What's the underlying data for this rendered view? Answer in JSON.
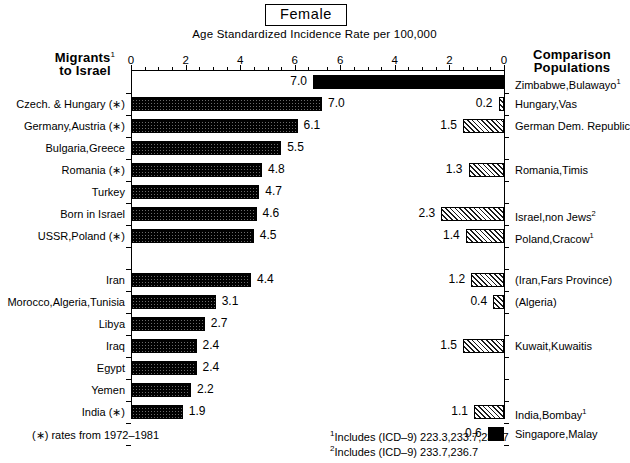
{
  "title": "Female",
  "subtitle": "Age Standardized Incidence Rate per 100,000",
  "headers": {
    "left_line1": "Migrants",
    "left_sup": "1",
    "left_line2": "to Israel",
    "right_line1": "Comparison",
    "right_line2": "Populations"
  },
  "axes": {
    "left_ticks": [
      "0",
      "2",
      "4",
      "6"
    ],
    "right_ticks": [
      "6",
      "4",
      "2",
      "0"
    ],
    "max": 7.4,
    "tick_step": 2,
    "minor_step": 0.5
  },
  "footnotes": {
    "left": "(∗) rates from 1972–1981",
    "right1_sup": "1",
    "right1": "Includes (ICD–9) 223.3,233.7,236.7",
    "right2_sup": "2",
    "right2": "Includes (ICD–9) 233.7,236.7"
  },
  "colors": {
    "solid": "#000000",
    "bar_dark": "#6a6a6a",
    "bar_light": "#efefef",
    "axis": "#000000",
    "background": "#ffffff"
  },
  "chart_data": {
    "type": "bar",
    "title": "Female",
    "subtitle": "Age Standardized Incidence Rate per 100,000",
    "xlabel": "Age Standardized Incidence Rate per 100,000",
    "ylabel": "",
    "orientation": "horizontal",
    "layout": "back-to-back (left panel grows right, right panel grows left)",
    "xlim": [
      0,
      7.4
    ],
    "xticks": [
      0,
      2,
      4,
      6
    ],
    "grid": false,
    "legend": "none",
    "rows": [
      {
        "index": 0,
        "left_label": "",
        "left_value": null,
        "right_label": "Zimbabwe,Bulawayo",
        "right_sup": "1",
        "right_value": 7.0,
        "right_fill": "solid"
      },
      {
        "index": 1,
        "left_label": "Czech. & Hungary (∗)",
        "left_value": 7.0,
        "right_label": "Hungary,Vas",
        "right_sup": "",
        "right_value": 0.2,
        "right_fill": "hatch"
      },
      {
        "index": 2,
        "left_label": "Germany,Austria (∗)",
        "left_value": 6.1,
        "right_label": "German Dem. Republic",
        "right_sup": "",
        "right_value": 1.5,
        "right_fill": "hatch"
      },
      {
        "index": 3,
        "left_label": "Bulgaria,Greece",
        "left_value": 5.5,
        "right_label": "",
        "right_sup": "",
        "right_value": null,
        "right_fill": ""
      },
      {
        "index": 4,
        "left_label": "Romania (∗)",
        "left_value": 4.8,
        "right_label": "Romania,Timis",
        "right_sup": "",
        "right_value": 1.3,
        "right_fill": "hatch"
      },
      {
        "index": 5,
        "left_label": "Turkey",
        "left_value": 4.7,
        "right_label": "",
        "right_sup": "",
        "right_value": null,
        "right_fill": ""
      },
      {
        "index": 6,
        "left_label": "Born in Israel",
        "left_value": 4.6,
        "right_label": "Israel,non Jews",
        "right_sup": "2",
        "right_value": 2.3,
        "right_fill": "hatch"
      },
      {
        "index": 7,
        "left_label": "USSR,Poland (∗)",
        "left_value": 4.5,
        "right_label": "Poland,Cracow",
        "right_sup": "1",
        "right_value": 1.4,
        "right_fill": "hatch"
      },
      {
        "index": 8,
        "left_label": "",
        "left_value": null,
        "right_label": "",
        "right_sup": "",
        "right_value": null,
        "right_fill": ""
      },
      {
        "index": 9,
        "left_label": "Iran",
        "left_value": 4.4,
        "right_label": "(Iran,Fars Province)",
        "right_sup": "",
        "right_value": 1.2,
        "right_fill": "hatch"
      },
      {
        "index": 10,
        "left_label": "Morocco,Algeria,Tunisia",
        "left_value": 3.1,
        "right_label": "(Algeria)",
        "right_sup": "",
        "right_value": 0.4,
        "right_fill": "hatch"
      },
      {
        "index": 11,
        "left_label": "Libya",
        "left_value": 2.7,
        "right_label": "",
        "right_sup": "",
        "right_value": null,
        "right_fill": ""
      },
      {
        "index": 12,
        "left_label": "Iraq",
        "left_value": 2.4,
        "right_label": "Kuwait,Kuwaitis",
        "right_sup": "",
        "right_value": 1.5,
        "right_fill": "hatch"
      },
      {
        "index": 13,
        "left_label": "Egypt",
        "left_value": 2.4,
        "right_label": "",
        "right_sup": "",
        "right_value": null,
        "right_fill": ""
      },
      {
        "index": 14,
        "left_label": "Yemen",
        "left_value": 2.2,
        "right_label": "",
        "right_sup": "",
        "right_value": null,
        "right_fill": ""
      },
      {
        "index": 15,
        "left_label": "India (∗)",
        "left_value": 1.9,
        "right_label": "India,Bombay",
        "right_sup": "1",
        "right_value": 1.1,
        "right_fill": "hatch"
      },
      {
        "index": 16,
        "left_label": "",
        "left_value": null,
        "right_label": "Singapore,Malay",
        "right_sup": "",
        "right_value": 0.6,
        "right_fill": "solid"
      }
    ]
  }
}
